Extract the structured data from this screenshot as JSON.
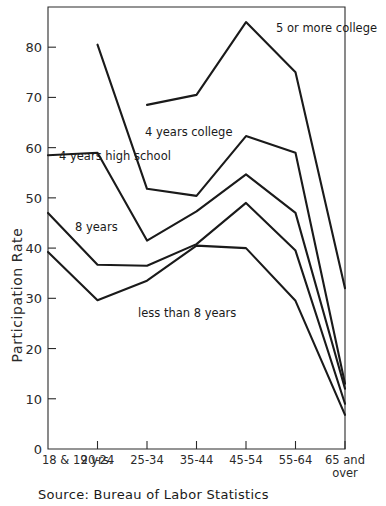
{
  "chart_data": {
    "type": "line",
    "title": "",
    "xlabel": "",
    "ylabel": "Participation Rate",
    "ylim": [
      0,
      88
    ],
    "yticks": [
      0,
      10,
      20,
      30,
      40,
      50,
      60,
      70,
      80
    ],
    "grid": false,
    "legend_position": "inline-annotations",
    "categories": [
      "18 & 19 yrs.",
      "20-24",
      "25-34",
      "35-44",
      "45-54",
      "55-64",
      "65 and over"
    ],
    "series": [
      {
        "name": "5 or more college",
        "label": "5 or more college",
        "x": [
          "25-34",
          "35-44",
          "45-54",
          "55-64",
          "65 and over"
        ],
        "values": [
          68.5,
          70.5,
          85.0,
          75.0,
          32.0
        ]
      },
      {
        "name": "4 years college",
        "label": "4 years college",
        "x": [
          "20-24",
          "25-34",
          "35-44",
          "45-54",
          "55-64",
          "65 and over"
        ],
        "values": [
          80.5,
          51.8,
          50.4,
          62.3,
          59.0,
          13.0
        ]
      },
      {
        "name": "4 years high school",
        "label": "4 years high school",
        "x": [
          "18 & 19 yrs.",
          "20-24",
          "25-34",
          "35-44",
          "45-54",
          "55-64",
          "65 and over"
        ],
        "values": [
          58.5,
          59.0,
          41.5,
          47.3,
          54.7,
          47.0,
          12.0
        ]
      },
      {
        "name": "8 years",
        "label": "8 years",
        "x": [
          "18 & 19 yrs.",
          "20-24",
          "25-34",
          "35-44",
          "45-54",
          "55-64",
          "65 and over"
        ],
        "values": [
          47.0,
          36.7,
          36.5,
          40.8,
          49.0,
          39.5,
          9.0
        ]
      },
      {
        "name": "less than 8 years",
        "label": "less than 8 years",
        "x": [
          "18 & 19 yrs.",
          "20-24",
          "25-34",
          "35-44",
          "45-54",
          "55-64",
          "65 and over"
        ],
        "values": [
          39.2,
          29.6,
          33.5,
          40.5,
          40.0,
          29.5,
          6.8
        ]
      }
    ],
    "annotations": [
      {
        "text": "5 or more college",
        "x_px": 276,
        "y_px": 32,
        "anchor": "start"
      },
      {
        "text": "4 years college",
        "x_px": 145,
        "y_px": 136,
        "anchor": "start"
      },
      {
        "text": "4 years high school",
        "x_px": 59,
        "y_px": 160,
        "anchor": "start"
      },
      {
        "text": "8 years",
        "x_px": 75,
        "y_px": 231,
        "anchor": "start"
      },
      {
        "text": "less than 8 years",
        "x_px": 138,
        "y_px": 317,
        "anchor": "start"
      }
    ],
    "source": "Source: Bureau of Labor Statistics",
    "xtick_second_line": {
      "65 and over": "over"
    },
    "colors": {
      "line": "#1a1a1a",
      "axis": "#2a2a2a",
      "background": "#ffffff"
    }
  }
}
